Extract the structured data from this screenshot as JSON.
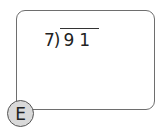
{
  "problem": {
    "divisor": "7",
    "bracket": ")",
    "dividend": "91"
  },
  "badge": {
    "label": "E"
  },
  "colors": {
    "border": "#6e6e6e",
    "badge_fill": "#d9d9d9",
    "text": "#222222"
  }
}
